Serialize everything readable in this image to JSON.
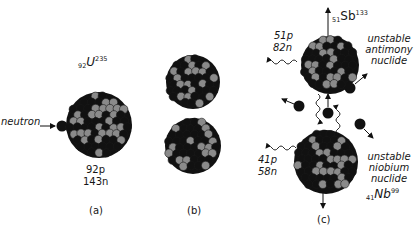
{
  "panels": {
    "a": {
      "caption": "(a)",
      "isotope": {
        "atomic_number": "92",
        "symbol": "U",
        "mass_number": "235"
      },
      "protons": "92p",
      "neutrons": "143n",
      "incoming_label": "neutron"
    },
    "b": {
      "caption": "(b)"
    },
    "c": {
      "caption": "(c)",
      "fragment_top": {
        "isotope": {
          "atomic_number": "51",
          "symbol": "Sb",
          "mass_number": "133"
        },
        "protons": "51p",
        "neutrons": "82n",
        "description": [
          "unstable",
          "antimony",
          "nuclide"
        ]
      },
      "fragment_bottom": {
        "isotope": {
          "atomic_number": "41",
          "symbol": "Nb",
          "mass_number": "99"
        },
        "protons": "41p",
        "neutrons": "58n",
        "description": [
          "unstable",
          "niobium",
          "nuclide"
        ]
      },
      "free_neutron_count": 4
    }
  },
  "colors": {
    "neutron": "#111111",
    "proton": "#8a8a8a",
    "background": "#ffffff"
  }
}
